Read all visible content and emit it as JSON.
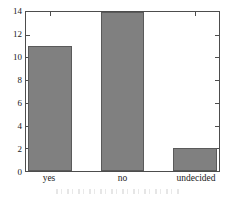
{
  "chart_data": {
    "type": "bar",
    "title": "",
    "subtitle": "",
    "xlabel": "",
    "ylabel": "",
    "categories": [
      "yes",
      "no",
      "undecided"
    ],
    "values": [
      11,
      14,
      2
    ],
    "series": [
      {
        "name": "responses",
        "values": [
          11,
          14,
          2
        ]
      }
    ],
    "ylim": [
      0,
      14
    ],
    "ytick_labels": [
      "0",
      "2",
      "4",
      "6",
      "8",
      "10",
      "12",
      "14"
    ],
    "ytick_values": [
      0,
      2,
      4,
      6,
      8,
      10,
      12,
      14
    ],
    "grid": false,
    "legend": false,
    "legend_position": "none",
    "colors": {
      "bar_fill": "#808080",
      "bar_edge": "#5a5a5a",
      "axis": "#4d4d4d",
      "text": "#1a1a1a",
      "background": "#ffffff"
    }
  }
}
